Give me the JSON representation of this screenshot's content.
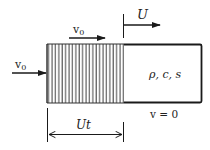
{
  "diagram": {
    "colors": {
      "stroke": "#1a1a1a",
      "hatch": "#2a2a2a",
      "background": "#ffffff"
    },
    "labels": {
      "inlet_velocity": "v",
      "inlet_velocity_sub": "0",
      "region_velocity": "v",
      "region_velocity_sub": "0",
      "front_speed": "U",
      "material_props": "ρ, c, s",
      "rest_velocity": "v = 0",
      "front_distance": "Ut"
    },
    "regions": [
      {
        "name": "compressed-region",
        "fill": "vertical-hatch",
        "x0": 47,
        "x1": 124
      },
      {
        "name": "undisturbed-region",
        "fill": "none",
        "x0": 124,
        "x1": 202
      }
    ],
    "arrows": [
      {
        "name": "inlet-velocity-arrow",
        "direction": "right"
      },
      {
        "name": "region-velocity-arrow",
        "direction": "right"
      },
      {
        "name": "front-speed-arrow",
        "direction": "right"
      },
      {
        "name": "distance-dimension-arrow",
        "direction": "both"
      }
    ]
  }
}
